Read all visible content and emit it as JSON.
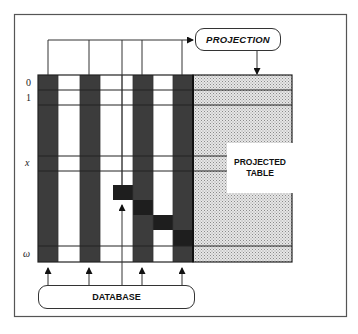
{
  "diagram": {
    "projection_label": "PROJECTION",
    "database_label": "DATABASE",
    "projected_table_label_line1": "PROJECTED",
    "projected_table_label_line2": "TABLE",
    "row_labels": [
      "0",
      "1",
      "x",
      "ω"
    ],
    "colors": {
      "dark_column": "#3c3c3c",
      "selected_cell": "#1e1e1e",
      "projected_table_fill": "#d4d4d4",
      "line": "#222222",
      "background": "#ffffff"
    },
    "matrix": {
      "columns": [
        {
          "x": 38,
          "w": 20,
          "type": "dark"
        },
        {
          "x": 58,
          "w": 22,
          "type": "light"
        },
        {
          "x": 80,
          "w": 20,
          "type": "dark"
        },
        {
          "x": 100,
          "w": 22,
          "type": "light"
        },
        {
          "x": 122,
          "w": 11,
          "type": "light"
        },
        {
          "x": 133,
          "w": 20,
          "type": "dark"
        },
        {
          "x": 153,
          "w": 20,
          "type": "light"
        },
        {
          "x": 173,
          "w": 20,
          "type": "dark"
        }
      ],
      "row_lines": [
        75,
        90,
        105,
        156,
        171,
        246,
        262
      ],
      "selected_cells": [
        {
          "x": 113,
          "y": 185,
          "w": 20,
          "h": 15
        },
        {
          "x": 133,
          "y": 200,
          "w": 20,
          "h": 15
        },
        {
          "x": 153,
          "y": 215,
          "w": 20,
          "h": 15
        },
        {
          "x": 173,
          "y": 230,
          "w": 20,
          "h": 16
        }
      ]
    }
  }
}
